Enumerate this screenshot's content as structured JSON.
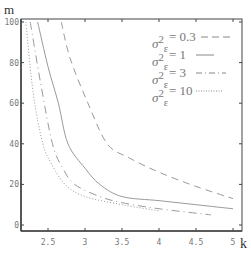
{
  "chart_data": {
    "type": "line",
    "title": "",
    "xlabel": "k",
    "ylabel": "m",
    "xlim": [
      2.14,
      5.05
    ],
    "ylim": [
      -3,
      102
    ],
    "grid": false,
    "legend_position": "upper right (inside)",
    "x_ticks": [
      "2.5",
      "3",
      "3.5",
      "4",
      "4.5",
      "5"
    ],
    "y_ticks": [
      "0",
      "20",
      "40",
      "60",
      "80",
      "100"
    ],
    "series": [
      {
        "name": "σ_ε² = 0.3",
        "style": "dashed",
        "x": [
          2.68,
          2.8,
          3.04,
          3.3,
          3.6,
          4.0,
          4.5,
          5.0
        ],
        "y": [
          100,
          82,
          60,
          40,
          33,
          26,
          19,
          13
        ]
      },
      {
        "name": "σ_ε² = 1",
        "style": "solid",
        "x": [
          2.36,
          2.5,
          2.64,
          2.77,
          3.0,
          3.2,
          3.5,
          4.0,
          4.5,
          5.0
        ],
        "y": [
          100,
          78,
          60,
          40,
          28,
          20,
          14,
          12,
          10,
          8
        ]
      },
      {
        "name": "σ_ε² = 3",
        "style": "dash-dot",
        "x": [
          2.26,
          2.4,
          2.56,
          2.7,
          2.86,
          3.2,
          3.5,
          4.0,
          4.7
        ],
        "y": [
          100,
          70,
          40,
          28,
          20,
          14,
          11,
          8,
          5
        ]
      },
      {
        "name": "σ_ε² = 10",
        "style": "dotted",
        "x": [
          2.2,
          2.3,
          2.43,
          2.55,
          2.73,
          3.0,
          3.5,
          4.0
        ],
        "y": [
          100,
          65,
          40,
          30,
          20,
          14,
          10,
          7
        ]
      }
    ]
  },
  "axes": {
    "x_label": "k",
    "y_label": "m"
  },
  "legend": [
    {
      "symbol": "σ",
      "sub": "ε",
      "sup": "2",
      "value": "= 0.3",
      "style": "dashed"
    },
    {
      "symbol": "σ",
      "sub": "ε",
      "sup": "2",
      "value": "= 1",
      "style": "solid"
    },
    {
      "symbol": "σ",
      "sub": "ε",
      "sup": "2",
      "value": "= 3",
      "style": "dash-dot"
    },
    {
      "symbol": "σ",
      "sub": "ε",
      "sup": "2",
      "value": "= 10",
      "style": "dotted"
    }
  ],
  "colors": {
    "axis": "#444444",
    "tick_text": "#777777",
    "curve": "#9a9a9a"
  }
}
